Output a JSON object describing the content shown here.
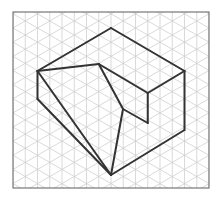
{
  "diagram": {
    "colors": {
      "background": "#ffffff",
      "grid": "#cfcfcf",
      "frame": "#777777",
      "shape": "#333333"
    },
    "frame": {
      "x": 13,
      "y": 12,
      "width": 196,
      "height": 176
    },
    "grid": {
      "column_spacing": 12.25,
      "angle_deg": 30
    },
    "vertices": {
      "A": [
        37.5,
        71
      ],
      "B": [
        111,
        28
      ],
      "C": [
        184.5,
        71
      ],
      "D": [
        98.75,
        64
      ],
      "E": [
        147.75,
        93
      ],
      "F": [
        184.5,
        130
      ],
      "G": [
        111,
        175
      ],
      "H": [
        37.5,
        99
      ],
      "I": [
        123,
        109
      ],
      "J": [
        147.75,
        123
      ]
    },
    "edges": [
      [
        "A",
        "B"
      ],
      [
        "B",
        "C"
      ],
      [
        "C",
        "F"
      ],
      [
        "F",
        "G"
      ],
      [
        "A",
        "H"
      ],
      [
        "H",
        "G"
      ],
      [
        "A",
        "D"
      ],
      [
        "D",
        "E"
      ],
      [
        "E",
        "C"
      ],
      [
        "E",
        "J"
      ],
      [
        "D",
        "I"
      ],
      [
        "I",
        "J"
      ],
      [
        "I",
        "G"
      ],
      [
        "A",
        "G"
      ]
    ]
  }
}
